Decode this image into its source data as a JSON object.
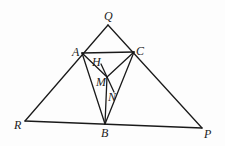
{
  "diagram": {
    "type": "geometry",
    "points": {
      "Q": {
        "x": 108,
        "y": 25,
        "label": "Q"
      },
      "A": {
        "x": 82,
        "y": 53,
        "label": "A"
      },
      "C": {
        "x": 134,
        "y": 52,
        "label": "C"
      },
      "R": {
        "x": 25,
        "y": 121,
        "label": "R"
      },
      "B": {
        "x": 105,
        "y": 124,
        "label": "B"
      },
      "P": {
        "x": 202,
        "y": 128,
        "label": "P"
      },
      "M": {
        "x": 107,
        "y": 77,
        "label": "M"
      },
      "H": {
        "x": 100,
        "y": 63,
        "label": "H"
      },
      "N": {
        "x": 114,
        "y": 92,
        "label": "N"
      }
    },
    "segments": [
      "QR",
      "QP",
      "RP",
      "AC",
      "AB",
      "CB",
      "AM",
      "CM",
      "MB",
      "HN"
    ],
    "labels": {
      "Q": "Q",
      "A": "A",
      "C": "C",
      "H": "H",
      "M": "M",
      "N": "N",
      "R": "R",
      "B": "B",
      "P": "P"
    }
  }
}
